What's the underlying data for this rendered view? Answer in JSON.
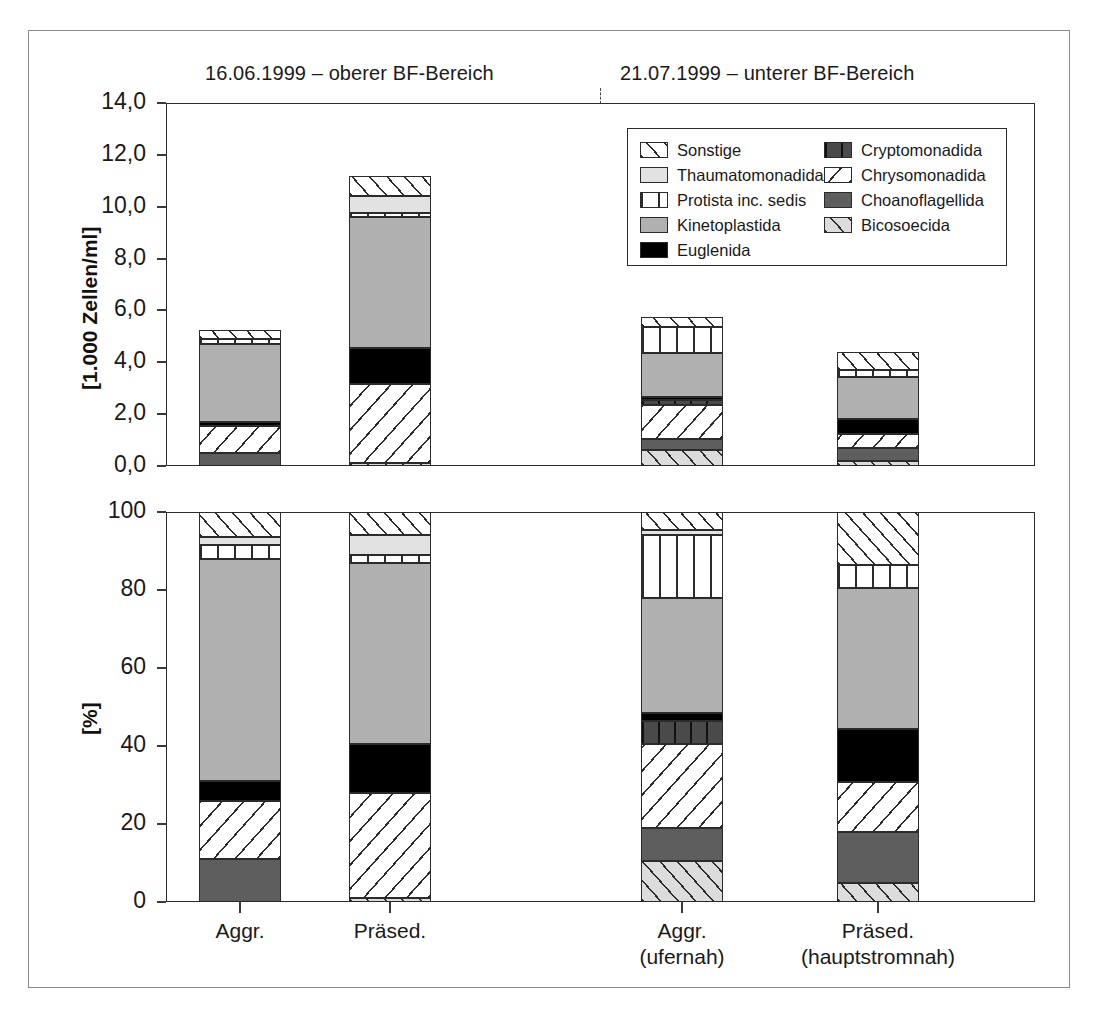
{
  "figure": {
    "panel_titles": {
      "left": "16.06.1999 – oberer BF-Bereich",
      "right": "21.07.1999 – unterer BF-Bereich"
    }
  },
  "legend": {
    "left_column": [
      {
        "key": "sonstige",
        "label": "Sonstige",
        "pattern": "diagonal-hatch-up-white"
      },
      {
        "key": "thaumatomonadida",
        "label": "Thaumatomonadida",
        "pattern": "solid-light-grey"
      },
      {
        "key": "protista_inc_sedis",
        "label": "Protista inc. sedis",
        "pattern": "vertical-lines-white"
      },
      {
        "key": "kinetoplastida",
        "label": "Kinetoplastida",
        "pattern": "solid-mid-grey"
      },
      {
        "key": "euglenida",
        "label": "Euglenida",
        "pattern": "solid-black"
      }
    ],
    "right_column": [
      {
        "key": "cryptomonadida",
        "label": "Cryptomonadida",
        "pattern": "vertical-lines-dark-grey"
      },
      {
        "key": "chrysomonadida",
        "label": "Chrysomonadida",
        "pattern": "diagonal-hatch-down-white"
      },
      {
        "key": "choanoflagellida",
        "label": "Choanoflagellida",
        "pattern": "solid-dark-grey"
      },
      {
        "key": "bicosoecida",
        "label": "Bicosoecida",
        "pattern": "diagonal-hatch-up-grey"
      }
    ]
  },
  "x_labels": [
    {
      "line1": "Aggr.",
      "line2": ""
    },
    {
      "line1": "Präsed.",
      "line2": ""
    },
    {
      "line1": "Aggr.",
      "line2": "(ufernah)"
    },
    {
      "line1": "Präsed.",
      "line2": "(hauptstromnah)"
    }
  ],
  "chart_data": [
    {
      "id": "abundance",
      "type": "bar",
      "stacked": true,
      "title": "",
      "xlabel": "",
      "ylabel": "[1.000 Zellen/ml]",
      "ylim": [
        0,
        14
      ],
      "yticks": [
        0,
        2,
        4,
        6,
        8,
        10,
        12,
        14
      ],
      "ytick_labels": [
        "0,0",
        "2,0",
        "4,0",
        "6,0",
        "8,0",
        "10,0",
        "12,0",
        "14,0"
      ],
      "grid": false,
      "legend_position": "inside-top-right",
      "categories": [
        "Aggr.",
        "Präsed.",
        "Aggr. (ufernah)",
        "Präsed. (hauptstromnah)"
      ],
      "series": [
        {
          "name": "Bicosoecida",
          "values": [
            0.0,
            0.1,
            0.6,
            0.2
          ]
        },
        {
          "name": "Choanoflagellida",
          "values": [
            0.5,
            0.0,
            0.45,
            0.5
          ]
        },
        {
          "name": "Chrysomonadida",
          "values": [
            1.05,
            3.05,
            1.3,
            0.55
          ]
        },
        {
          "name": "Cryptomonadida",
          "values": [
            0.0,
            0.0,
            0.2,
            0.0
          ]
        },
        {
          "name": "Euglenida",
          "values": [
            0.15,
            1.4,
            0.1,
            0.55
          ]
        },
        {
          "name": "Kinetoplastida",
          "values": [
            3.0,
            5.05,
            1.7,
            1.65
          ]
        },
        {
          "name": "Protista inc. sedis",
          "values": [
            0.2,
            0.15,
            1.0,
            0.25
          ]
        },
        {
          "name": "Thaumatomonadida",
          "values": [
            0.0,
            0.65,
            0.0,
            0.0
          ]
        },
        {
          "name": "Sonstige",
          "values": [
            0.35,
            0.8,
            0.4,
            0.7
          ]
        }
      ],
      "totals": [
        5.25,
        11.2,
        5.75,
        4.4
      ]
    },
    {
      "id": "relative",
      "type": "bar",
      "stacked": true,
      "title": "",
      "xlabel": "",
      "ylabel": "[%]",
      "ylim": [
        0,
        100
      ],
      "yticks": [
        0,
        20,
        40,
        60,
        80,
        100
      ],
      "ytick_labels": [
        "0",
        "20",
        "40",
        "60",
        "80",
        "100"
      ],
      "grid": false,
      "legend_position": "none",
      "categories": [
        "Aggr.",
        "Präsed.",
        "Aggr. (ufernah)",
        "Präsed. (hauptstromnah)"
      ],
      "series": [
        {
          "name": "Bicosoecida",
          "values": [
            0.0,
            1.0,
            10.5,
            4.8
          ]
        },
        {
          "name": "Choanoflagellida",
          "values": [
            11.0,
            0.0,
            8.5,
            13.2
          ]
        },
        {
          "name": "Chrysomonadida",
          "values": [
            15.0,
            27.0,
            21.5,
            12.8
          ]
        },
        {
          "name": "Cryptomonadida",
          "values": [
            0.0,
            0.0,
            6.0,
            0.0
          ]
        },
        {
          "name": "Euglenida",
          "values": [
            5.0,
            12.5,
            2.0,
            13.5
          ]
        },
        {
          "name": "Kinetoplastida",
          "values": [
            57.0,
            46.5,
            29.5,
            36.2
          ]
        },
        {
          "name": "Protista inc. sedis",
          "values": [
            3.5,
            2.0,
            16.0,
            6.0
          ]
        },
        {
          "name": "Thaumatomonadida",
          "values": [
            2.0,
            5.0,
            1.5,
            0.0
          ]
        },
        {
          "name": "Sonstige",
          "values": [
            6.5,
            6.0,
            4.5,
            13.5
          ]
        }
      ],
      "totals": [
        100,
        100,
        100,
        100
      ]
    }
  ]
}
